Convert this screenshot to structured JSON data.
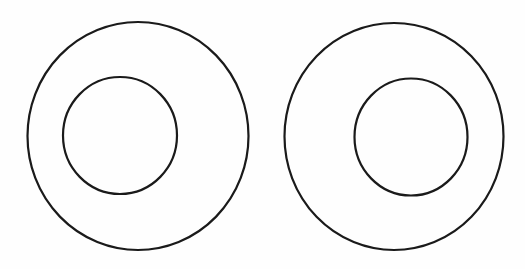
{
  "diagram": {
    "stroke_color": "#1a1a1a",
    "background_color": "#fefefe",
    "stroke_width": 2.2,
    "figures": [
      {
        "id": "left",
        "outer": {
          "cx": 138,
          "cy": 136,
          "rx": 110.5,
          "ry": 114
        },
        "inner": {
          "cx": 120,
          "cy": 135.5,
          "rx": 57,
          "ry": 58.5
        }
      },
      {
        "id": "right",
        "outer": {
          "cx": 394,
          "cy": 136.5,
          "rx": 109.5,
          "ry": 113.5
        },
        "inner": {
          "cx": 411,
          "cy": 137,
          "rx": 56.5,
          "ry": 58.5
        }
      }
    ]
  }
}
